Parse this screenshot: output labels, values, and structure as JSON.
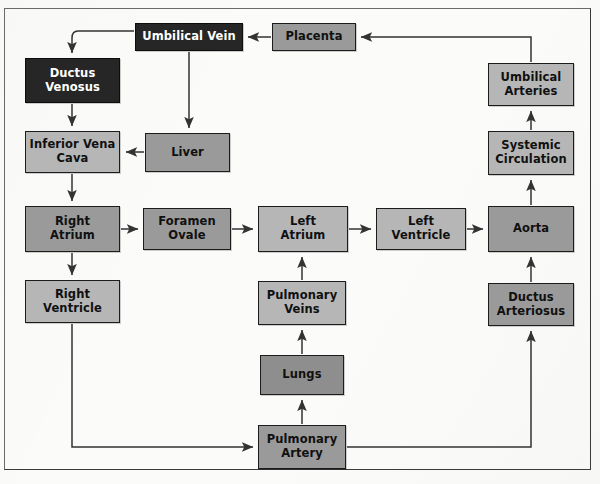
{
  "diagram": {
    "palette": {
      "background": "#fbfbfa",
      "box_light": "#b6b6b6",
      "box_mid": "#9a9a9a",
      "box_dark": "#8e8e8e",
      "box_black": "#262626",
      "border": "#1c1c1c",
      "arrow": "#333333",
      "text_dark": "#101010",
      "text_light": "#ffffff"
    },
    "nodes": [
      {
        "id": "umbilical-vein",
        "label": "Umbilical Vein",
        "x": 135,
        "y": 23,
        "w": 108,
        "h": 28,
        "fill": "black"
      },
      {
        "id": "placenta",
        "label": "Placenta",
        "x": 272,
        "y": 23,
        "w": 84,
        "h": 28,
        "fill": "mid"
      },
      {
        "id": "ductus-venosus",
        "label": "Ductus\nVenosus",
        "x": 25,
        "y": 58,
        "w": 95,
        "h": 45,
        "fill": "black"
      },
      {
        "id": "umbilical-arteries",
        "label": "Umbilical\nArteries",
        "x": 488,
        "y": 63,
        "w": 86,
        "h": 43,
        "fill": "light"
      },
      {
        "id": "inferior-vena-cava",
        "label": "Inferior Vena\nCava",
        "x": 25,
        "y": 131,
        "w": 95,
        "h": 42,
        "fill": "light"
      },
      {
        "id": "liver",
        "label": "Liver",
        "x": 145,
        "y": 133,
        "w": 85,
        "h": 39,
        "fill": "mid"
      },
      {
        "id": "systemic-circulation",
        "label": "Systemic\nCirculation",
        "x": 488,
        "y": 131,
        "w": 86,
        "h": 44,
        "fill": "light"
      },
      {
        "id": "right-atrium",
        "label": "Right\nAtrium",
        "x": 25,
        "y": 206,
        "w": 95,
        "h": 46,
        "fill": "mid"
      },
      {
        "id": "foramen-ovale",
        "label": "Foramen\nOvale",
        "x": 143,
        "y": 208,
        "w": 88,
        "h": 42,
        "fill": "mid"
      },
      {
        "id": "left-atrium",
        "label": "Left\nAtrium",
        "x": 258,
        "y": 206,
        "w": 90,
        "h": 46,
        "fill": "light"
      },
      {
        "id": "left-ventricle",
        "label": "Left\nVentricle",
        "x": 376,
        "y": 208,
        "w": 90,
        "h": 42,
        "fill": "light"
      },
      {
        "id": "aorta",
        "label": "Aorta",
        "x": 488,
        "y": 206,
        "w": 86,
        "h": 46,
        "fill": "mid"
      },
      {
        "id": "right-ventricle",
        "label": "Right\nVentricle",
        "x": 25,
        "y": 280,
        "w": 95,
        "h": 43,
        "fill": "light"
      },
      {
        "id": "pulmonary-veins",
        "label": "Pulmonary\nVeins",
        "x": 258,
        "y": 281,
        "w": 88,
        "h": 44,
        "fill": "light"
      },
      {
        "id": "ductus-arteriosus",
        "label": "Ductus\nArteriosus",
        "x": 488,
        "y": 283,
        "w": 86,
        "h": 43,
        "fill": "mid"
      },
      {
        "id": "lungs",
        "label": "Lungs",
        "x": 260,
        "y": 355,
        "w": 84,
        "h": 40,
        "fill": "dark"
      },
      {
        "id": "pulmonary-artery",
        "label": "Pulmonary\nArtery",
        "x": 258,
        "y": 425,
        "w": 88,
        "h": 44,
        "fill": "mid"
      }
    ],
    "edges": [
      {
        "id": "placenta-to-umbilical-vein",
        "from": "placenta",
        "to": "umbilical-vein"
      },
      {
        "id": "umbilical-vein-to-ductus-venosus",
        "from": "umbilical-vein",
        "to": "ductus-venosus"
      },
      {
        "id": "umbilical-vein-to-liver",
        "from": "umbilical-vein",
        "to": "liver"
      },
      {
        "id": "ductus-venosus-to-inferior-vena-cava",
        "from": "ductus-venosus",
        "to": "inferior-vena-cava"
      },
      {
        "id": "liver-to-inferior-vena-cava",
        "from": "liver",
        "to": "inferior-vena-cava"
      },
      {
        "id": "inferior-vena-cava-to-right-atrium",
        "from": "inferior-vena-cava",
        "to": "right-atrium"
      },
      {
        "id": "right-atrium-to-foramen-ovale",
        "from": "right-atrium",
        "to": "foramen-ovale"
      },
      {
        "id": "right-atrium-to-right-ventricle",
        "from": "right-atrium",
        "to": "right-ventricle"
      },
      {
        "id": "foramen-ovale-to-left-atrium",
        "from": "foramen-ovale",
        "to": "left-atrium"
      },
      {
        "id": "left-atrium-to-left-ventricle",
        "from": "left-atrium",
        "to": "left-ventricle"
      },
      {
        "id": "left-ventricle-to-aorta",
        "from": "left-ventricle",
        "to": "aorta"
      },
      {
        "id": "aorta-to-systemic-circulation",
        "from": "aorta",
        "to": "systemic-circulation"
      },
      {
        "id": "systemic-circulation-to-umbilical-arteries",
        "from": "systemic-circulation",
        "to": "umbilical-arteries"
      },
      {
        "id": "umbilical-arteries-to-placenta",
        "from": "umbilical-arteries",
        "to": "placenta"
      },
      {
        "id": "right-ventricle-to-pulmonary-artery",
        "from": "right-ventricle",
        "to": "pulmonary-artery"
      },
      {
        "id": "pulmonary-artery-to-lungs",
        "from": "pulmonary-artery",
        "to": "lungs"
      },
      {
        "id": "lungs-to-pulmonary-veins",
        "from": "lungs",
        "to": "pulmonary-veins"
      },
      {
        "id": "pulmonary-veins-to-left-atrium",
        "from": "pulmonary-veins",
        "to": "left-atrium"
      },
      {
        "id": "pulmonary-artery-to-ductus-arteriosus",
        "from": "pulmonary-artery",
        "to": "ductus-arteriosus"
      },
      {
        "id": "ductus-arteriosus-to-aorta",
        "from": "ductus-arteriosus",
        "to": "aorta"
      }
    ]
  }
}
